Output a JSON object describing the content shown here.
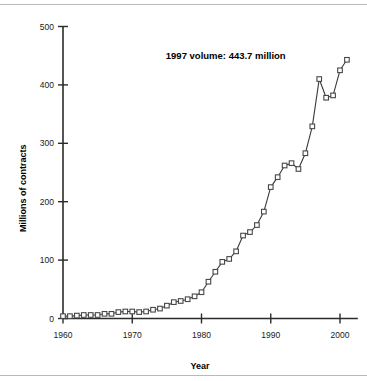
{
  "chart_data": {
    "type": "line",
    "title": "",
    "subtitle": "",
    "xlabel": "Year",
    "ylabel": "Millions of contracts",
    "xlim": [
      1959,
      2002
    ],
    "ylim": [
      0,
      500
    ],
    "xticks": [
      1960,
      1970,
      1980,
      1990,
      2000
    ],
    "xtick_labels": [
      "1960",
      "1970",
      "1980",
      "1990",
      "2000"
    ],
    "yticks": [
      0,
      100,
      200,
      300,
      400,
      500
    ],
    "ytick_labels": [
      "0",
      "100",
      "200",
      "300",
      "400",
      "500"
    ],
    "grid": false,
    "legend": false,
    "marker": "open-square",
    "annotations": [
      {
        "text": "1997 volume: 443.7 million",
        "x": 1983.5,
        "y": 443.7,
        "bold": true
      }
    ],
    "series": [
      {
        "name": "Futures and options contract volume",
        "x": [
          1960,
          1961,
          1962,
          1963,
          1964,
          1965,
          1966,
          1967,
          1968,
          1969,
          1970,
          1971,
          1972,
          1973,
          1974,
          1975,
          1976,
          1977,
          1978,
          1979,
          1980,
          1981,
          1982,
          1983,
          1984,
          1985,
          1986,
          1987,
          1988,
          1989,
          1990,
          1991,
          1992,
          1993,
          1994,
          1995,
          1996,
          1997,
          1998,
          1999,
          2000,
          2001
        ],
        "values": [
          4,
          4,
          5,
          6,
          6,
          6,
          8,
          8,
          11,
          12,
          12,
          11,
          12,
          15,
          17,
          22,
          28,
          30,
          33,
          38,
          45,
          63,
          80,
          97,
          102,
          115,
          142,
          148,
          160,
          183,
          225,
          242,
          262,
          266,
          256,
          283,
          329,
          410,
          378,
          382,
          425,
          443
        ]
      }
    ]
  }
}
